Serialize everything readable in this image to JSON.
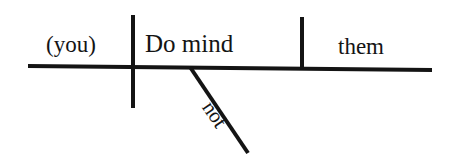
{
  "diagram": {
    "type": "reed-kellogg-sentence-diagram",
    "background_color": "#ffffff",
    "ink_color": "#141414",
    "slots": {
      "subject": "(you)",
      "verb": "Do mind",
      "direct_object": "them",
      "adverb_modifier": "not"
    },
    "lines": {
      "baseline": {
        "name": "main-baseline",
        "x1": 28,
        "y1": 66,
        "x2": 432,
        "y2": 70,
        "width": 4
      },
      "subject_divider": {
        "name": "subject-verb-divider",
        "x1": 133,
        "y1": 15,
        "x2": 133,
        "y2": 108,
        "width": 4
      },
      "object_divider": {
        "name": "verb-object-divider",
        "x1": 302,
        "y1": 17,
        "x2": 302,
        "y2": 69,
        "width": 4
      },
      "modifier_slant": {
        "name": "adverb-slant-line",
        "x1": 190,
        "y1": 67,
        "x2": 248,
        "y2": 153,
        "width": 4
      }
    }
  }
}
